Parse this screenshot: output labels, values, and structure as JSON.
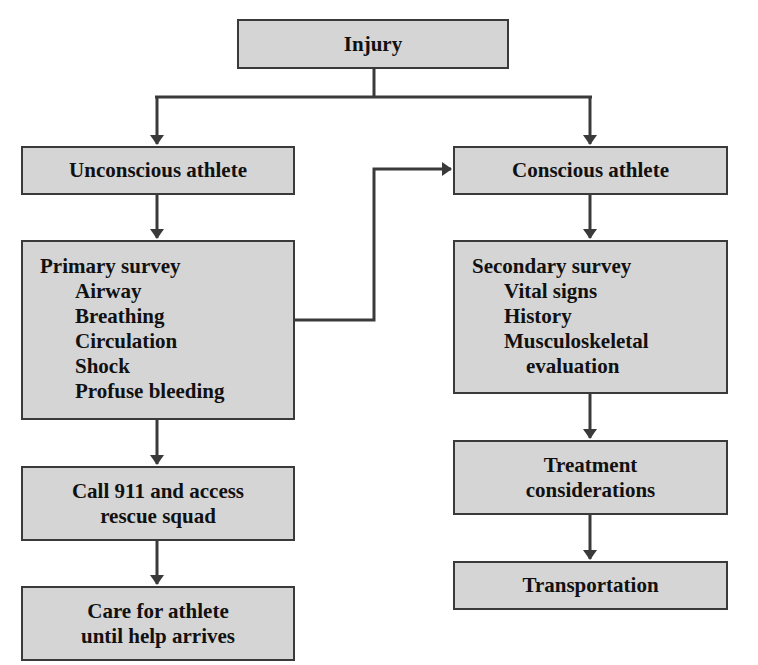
{
  "diagram": {
    "type": "flowchart",
    "nodes": {
      "injury": {
        "label": "Injury"
      },
      "unconscious": {
        "label": "Unconscious athlete"
      },
      "conscious": {
        "label": "Conscious athlete"
      },
      "primary": {
        "title": "Primary survey",
        "items": [
          "Airway",
          "Breathing",
          "Circulation",
          "Shock",
          "Profuse bleeding"
        ]
      },
      "secondary": {
        "title": "Secondary survey",
        "items": [
          "Vital signs",
          "History",
          "Musculoskeletal"
        ],
        "continuation": "evaluation"
      },
      "call911": {
        "line1": "Call 911 and access",
        "line2": "rescue squad"
      },
      "care": {
        "line1": "Care for athlete",
        "line2": "until help arrives"
      },
      "treatment": {
        "line1": "Treatment",
        "line2": "considerations"
      },
      "transportation": {
        "label": "Transportation"
      }
    },
    "edges": [
      [
        "Injury",
        "Unconscious athlete"
      ],
      [
        "Injury",
        "Conscious athlete"
      ],
      [
        "Unconscious athlete",
        "Primary survey"
      ],
      [
        "Primary survey",
        "Conscious athlete"
      ],
      [
        "Primary survey",
        "Call 911 and access rescue squad"
      ],
      [
        "Call 911 and access rescue squad",
        "Care for athlete until help arrives"
      ],
      [
        "Conscious athlete",
        "Secondary survey"
      ],
      [
        "Secondary survey",
        "Treatment considerations"
      ],
      [
        "Treatment considerations",
        "Transportation"
      ]
    ],
    "colors": {
      "box_fill": "#d5d5d5",
      "border": "#3a3a3a",
      "arrow": "#3a3a3a"
    }
  }
}
